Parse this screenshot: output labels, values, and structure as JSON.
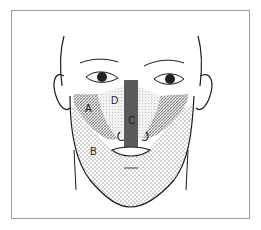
{
  "diagram": {
    "regions": [
      {
        "label": "A",
        "pattern": "cross-hatch",
        "description": "lateral cheek region"
      },
      {
        "label": "B",
        "pattern": "stipple",
        "description": "lower face / jaw / beard region"
      },
      {
        "label": "C",
        "pattern": "solid-dark",
        "description": "central nasal strip to upper lip"
      },
      {
        "label": "D",
        "pattern": "light-dot",
        "description": "medial cheek / paranasal region"
      }
    ],
    "labels": {
      "a": "A",
      "b": "B",
      "c": "C",
      "d": "D"
    },
    "colors": {
      "line": "#1a1a1a",
      "region_c": "#5a5a5a",
      "frame": "#9a9a9a"
    }
  }
}
